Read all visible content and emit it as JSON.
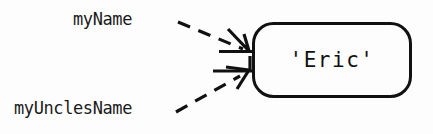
{
  "diagram": {
    "type": "variable-reference-diagram",
    "background_color": "#fdfdfd",
    "stroke_color": "#111111",
    "text_color": "#1a1a1a",
    "box": {
      "label": "'Eric'",
      "shape": "rounded-rectangle",
      "x": 252,
      "y": 22,
      "width": 160,
      "height": 76,
      "corner_radius": 20,
      "border_width": 3
    },
    "variables": [
      {
        "name": "myName",
        "label": "myName",
        "arrow_style": "dashed",
        "arrow_direction": "down-right",
        "points_to": "'Eric'"
      },
      {
        "name": "myUnclesName",
        "label": "myUnclesName",
        "arrow_style": "dashed",
        "arrow_direction": "up-right",
        "points_to": "'Eric'"
      }
    ]
  }
}
